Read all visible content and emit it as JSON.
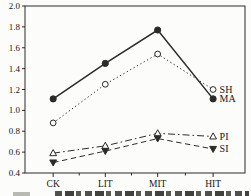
{
  "figure": {
    "background": "#fcfcfb",
    "frame_color": "#2b2b28",
    "text_color": "#171715",
    "plot_area": {
      "left": 25,
      "top": 6,
      "right": 245,
      "bottom": 173
    }
  },
  "chart_data": {
    "type": "line",
    "title": "",
    "xlabel": "",
    "ylabel": "",
    "categories": [
      "CK",
      "LIT",
      "MIT",
      "HIT"
    ],
    "category_x_fractions": [
      0.128,
      0.365,
      0.603,
      0.855
    ],
    "series": [
      {
        "name": "SH",
        "values": [
          0.88,
          1.25,
          1.54,
          1.2
        ],
        "marker": "open-circle",
        "line_style": "dotted",
        "line_width": 1.0
      },
      {
        "name": "MA",
        "values": [
          1.11,
          1.45,
          1.77,
          1.11
        ],
        "marker": "filled-circle",
        "line_style": "solid",
        "line_width": 1.5
      },
      {
        "name": "PI",
        "values": [
          0.59,
          0.66,
          0.78,
          0.75
        ],
        "marker": "open-triangle-up",
        "line_style": "dash-dot",
        "line_width": 1.0
      },
      {
        "name": "SI",
        "values": [
          0.5,
          0.61,
          0.73,
          0.63
        ],
        "marker": "filled-triangle-down",
        "line_style": "dashed",
        "line_width": 1.0
      }
    ],
    "ylim": [
      0.4,
      2.0
    ],
    "ytick_step": 0.2,
    "ytick_labels": [
      "0.4",
      "0.6",
      "0.8",
      "1.0",
      "1.2",
      "1.4",
      "1.6",
      "1.8",
      "2.0"
    ],
    "grid": false,
    "legend_position": "labels-at-line-ends",
    "end_labels": [
      "SH",
      "MA",
      "PI",
      "SI"
    ]
  }
}
